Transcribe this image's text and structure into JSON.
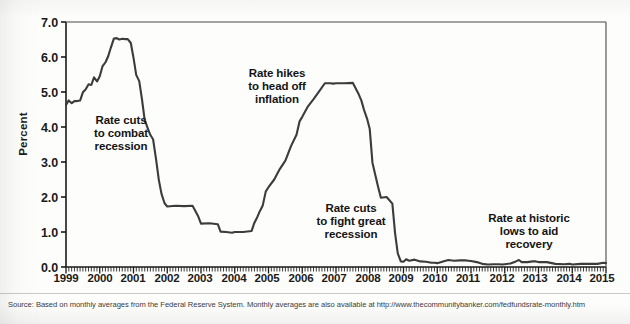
{
  "figure": {
    "source_note": "Source: Based on monthly averages from the Federal Reserve System. Monthly averages are also available at http://www.thecommunitybanker.com/fedfundsrate-monthly.htm",
    "line_color": "#3c3c3c",
    "axis_color": "#1a1a1a",
    "background": "#fdfdfb"
  },
  "chart_data": {
    "type": "line",
    "title": "",
    "xlabel": "",
    "ylabel": "Percent",
    "ylim": [
      0.0,
      7.0
    ],
    "xlim": [
      1999.0,
      2015.0
    ],
    "grid": false,
    "legend": "none",
    "ytick_labels": [
      "7.0",
      "6.0",
      "5.0",
      "4.0",
      "3.0",
      "2.0",
      "1.0",
      "0.0"
    ],
    "ytick_values": [
      7.0,
      6.0,
      5.0,
      4.0,
      3.0,
      2.0,
      1.0,
      0.0
    ],
    "xtick_labels": [
      "1999",
      "2000",
      "2001",
      "2002",
      "2003",
      "2004",
      "2005",
      "2006",
      "2007",
      "2008",
      "2009",
      "2010",
      "2011",
      "2012",
      "2013",
      "2014",
      "2015"
    ],
    "xtick_values": [
      1999,
      2000,
      2001,
      2002,
      2003,
      2004,
      2005,
      2006,
      2007,
      2008,
      2009,
      2010,
      2011,
      2012,
      2013,
      2014,
      2015
    ],
    "minor_ticks_per_year": 12,
    "series": [
      {
        "name": "Federal funds rate",
        "x": [
          1999.0,
          1999.08,
          1999.17,
          1999.25,
          1999.33,
          1999.42,
          1999.5,
          1999.58,
          1999.67,
          1999.75,
          1999.83,
          1999.92,
          2000.0,
          2000.08,
          2000.17,
          2000.25,
          2000.33,
          2000.42,
          2000.5,
          2000.58,
          2000.67,
          2000.75,
          2000.83,
          2000.92,
          2001.0,
          2001.08,
          2001.17,
          2001.25,
          2001.33,
          2001.42,
          2001.5,
          2001.58,
          2001.67,
          2001.75,
          2001.83,
          2001.92,
          2002.0,
          2002.25,
          2002.5,
          2002.75,
          2002.92,
          2003.0,
          2003.25,
          2003.5,
          2003.58,
          2003.75,
          2003.92,
          2004.0,
          2004.25,
          2004.5,
          2004.58,
          2004.67,
          2004.75,
          2004.83,
          2004.92,
          2005.0,
          2005.17,
          2005.33,
          2005.5,
          2005.67,
          2005.83,
          2005.92,
          2006.0,
          2006.17,
          2006.33,
          2006.5,
          2006.67,
          2006.83,
          2006.92,
          2007.0,
          2007.25,
          2007.5,
          2007.67,
          2007.75,
          2007.83,
          2007.92,
          2008.0,
          2008.08,
          2008.17,
          2008.25,
          2008.33,
          2008.5,
          2008.67,
          2008.75,
          2008.83,
          2008.92,
          2009.0,
          2009.08,
          2009.17,
          2009.33,
          2009.5,
          2009.67,
          2009.83,
          2009.92,
          2010.0,
          2010.17,
          2010.33,
          2010.5,
          2010.67,
          2010.83,
          2010.92,
          2011.0,
          2011.17,
          2011.33,
          2011.5,
          2011.67,
          2011.83,
          2011.92,
          2012.0,
          2012.17,
          2012.33,
          2012.42,
          2012.5,
          2012.67,
          2012.83,
          2012.92,
          2013.0,
          2013.25,
          2013.5,
          2013.75,
          2013.92,
          2014.0,
          2014.25,
          2014.5,
          2014.75,
          2014.92,
          2015.0
        ],
        "y": [
          4.63,
          4.76,
          4.68,
          4.74,
          4.74,
          4.76,
          4.99,
          5.07,
          5.22,
          5.2,
          5.42,
          5.3,
          5.45,
          5.73,
          5.85,
          6.02,
          6.27,
          6.53,
          6.54,
          6.5,
          6.52,
          6.51,
          6.51,
          6.4,
          5.98,
          5.49,
          5.31,
          4.8,
          4.21,
          3.97,
          3.77,
          3.65,
          3.07,
          2.49,
          2.09,
          1.82,
          1.73,
          1.75,
          1.74,
          1.75,
          1.44,
          1.24,
          1.25,
          1.22,
          1.01,
          1.0,
          0.98,
          1.0,
          1.0,
          1.03,
          1.26,
          1.43,
          1.61,
          1.76,
          2.16,
          2.28,
          2.5,
          2.79,
          3.04,
          3.46,
          3.78,
          4.16,
          4.29,
          4.59,
          4.79,
          5.02,
          5.25,
          5.25,
          5.24,
          5.25,
          5.25,
          5.26,
          4.94,
          4.76,
          4.49,
          4.24,
          3.94,
          2.98,
          2.61,
          2.28,
          1.98,
          2.0,
          1.81,
          0.97,
          0.39,
          0.16,
          0.15,
          0.22,
          0.18,
          0.21,
          0.16,
          0.15,
          0.12,
          0.12,
          0.11,
          0.16,
          0.2,
          0.18,
          0.19,
          0.19,
          0.18,
          0.17,
          0.14,
          0.09,
          0.07,
          0.08,
          0.08,
          0.07,
          0.08,
          0.1,
          0.16,
          0.2,
          0.14,
          0.14,
          0.16,
          0.16,
          0.14,
          0.14,
          0.09,
          0.08,
          0.09,
          0.07,
          0.09,
          0.09,
          0.09,
          0.12,
          0.11
        ]
      }
    ],
    "annotations": [
      {
        "id": "rate-cuts-recession",
        "text_lines": [
          "Rate cuts",
          "to combat",
          "recession"
        ],
        "x": 2000.6,
        "y": 3.7
      },
      {
        "id": "rate-hikes-inflation",
        "text_lines": [
          "Rate hikes",
          "to head off",
          "inflation"
        ],
        "x": 2005.3,
        "y": 5.6
      },
      {
        "id": "rate-cuts-great-recession",
        "text_lines": [
          "Rate cuts",
          "to fight great",
          "recession"
        ],
        "x": 2008.2,
        "y": 1.9
      },
      {
        "id": "rate-historic-lows",
        "text_lines": [
          "Rate at historic",
          "lows to aid",
          "recovery"
        ],
        "x": 2013.0,
        "y": 1.55
      }
    ]
  }
}
